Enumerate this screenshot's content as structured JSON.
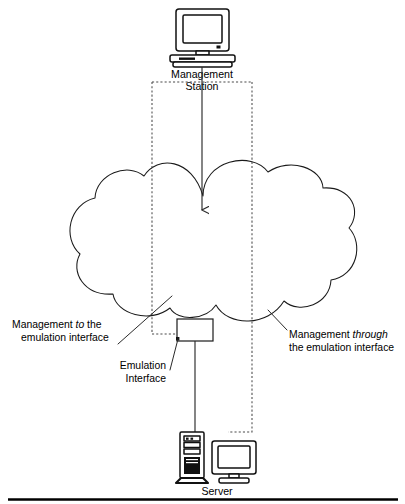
{
  "figure": {
    "background_color": "#ffffff",
    "line_color": "#1a1a1a",
    "dashed_color": "#4a4a4a"
  },
  "nodes": {
    "management_station": {
      "label_line1": "Management",
      "label_line2": "Station",
      "icon": "desktop-computer-icon"
    },
    "cloud": {
      "label": "",
      "icon": "network-cloud-icon"
    },
    "emulation_interface": {
      "label_line1": "Emulation",
      "label_line2": "Interface",
      "icon": "interface-box-icon"
    },
    "server": {
      "label": "Server",
      "icon": "tower-server-icon",
      "secondary_icon": "desktop-monitor-icon"
    }
  },
  "annotations": {
    "left": {
      "line1_prefix": "Management ",
      "line1_emphasis": "to",
      "line1_suffix": " the",
      "line2": "emulation interface"
    },
    "right": {
      "line1_prefix": "Management ",
      "line1_emphasis": "through",
      "line1_suffix": "",
      "line2": "the emulation interface"
    }
  },
  "connections": [
    {
      "name": "management-station-to-cloud",
      "style": "solid-arrow",
      "from": "management_station",
      "to": "cloud"
    },
    {
      "name": "management-to-emulation-interface",
      "style": "dashed",
      "from": "management_station",
      "to": "emulation_interface"
    },
    {
      "name": "management-through-to-server",
      "style": "dashed",
      "from": "management_station",
      "to": "server"
    },
    {
      "name": "emulation-interface-to-server",
      "style": "solid",
      "from": "emulation_interface",
      "to": "server"
    }
  ]
}
